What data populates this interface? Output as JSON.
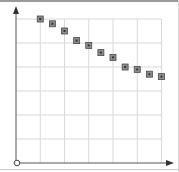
{
  "chart_data": {
    "type": "scatter",
    "title": "",
    "xlabel": "",
    "ylabel": "",
    "xlim": [
      0,
      6
    ],
    "ylim": [
      0,
      6
    ],
    "grid": true,
    "grid_cells": {
      "x": 6,
      "y": 6
    },
    "legend": null,
    "tick_labels_visible": false,
    "marker": "square",
    "colors": {
      "marker_fill": "#8c8c8c",
      "marker_edge": "#4a4a4a",
      "grid": "#d9d9d9",
      "axis": "#555555"
    },
    "series": [
      {
        "name": "points",
        "x": [
          1.0,
          1.5,
          2.0,
          2.5,
          3.0,
          3.5,
          4.0,
          4.5,
          5.0,
          5.5,
          6.0
        ],
        "y": [
          6.0,
          5.8,
          5.5,
          5.1,
          4.9,
          4.6,
          4.4,
          4.0,
          3.9,
          3.7,
          3.6
        ]
      }
    ]
  }
}
